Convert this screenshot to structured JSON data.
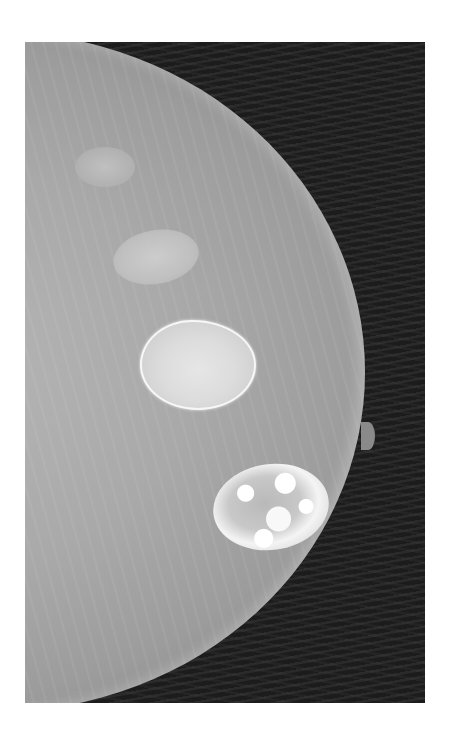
{
  "image": {
    "subject": "mammogram",
    "description": "Grayscale mammogram of a breast with two dense calcified masses and a smaller oval opacity",
    "colors": {
      "page_background": "#ffffff",
      "frame_background": "#161616",
      "tissue": "#a9a9a9",
      "calcification": "#f4f4f4"
    }
  }
}
